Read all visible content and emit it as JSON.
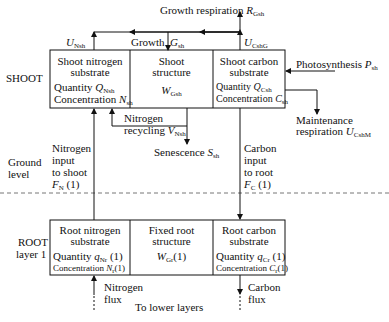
{
  "shoot": {
    "label": "SHOOT",
    "nitrogen_substrate": {
      "title1": "Shoot nitrogen",
      "title2": "substrate",
      "quantity_label": "Quantity",
      "quantity_sym": "Q",
      "quantity_sub": "Nsh",
      "conc_label": "Concentration",
      "conc_sym": "N",
      "conc_sub": "sh"
    },
    "structure": {
      "title1": "Shoot",
      "title2": "structure",
      "sym": "W",
      "sub": "Gsh"
    },
    "carbon_substrate": {
      "title1": "Shoot carbon",
      "title2": "substrate",
      "quantity_label": "Quantity",
      "quantity_sym": "Q",
      "quantity_sub": "Csh",
      "conc_label": "Concentration",
      "conc_sym": "C",
      "conc_sub": "sh"
    }
  },
  "root": {
    "label1": "ROOT",
    "label2": "layer 1",
    "nitrogen_substrate": {
      "title1": "Root nitrogen",
      "title2": "substrate",
      "quantity_label": "Quantity",
      "quantity_sym": "q",
      "quantity_sub": "Nr",
      "quantity_arg": "(1)",
      "conc_label": "Concentration",
      "conc_sym": "N",
      "conc_sub": "r",
      "conc_arg": "(1)"
    },
    "structure": {
      "title1": "Fixed root",
      "title2": "structure",
      "sym": "W",
      "sub": "Gr",
      "arg": "(1)"
    },
    "carbon_substrate": {
      "title1": "Root carbon",
      "title2": "substrate",
      "quantity_label": "Quantity",
      "quantity_sym": "q",
      "quantity_sub": "Cr",
      "quantity_arg": "(1)",
      "conc_label": "Concentration",
      "conc_sym": "C",
      "conc_sub": "r",
      "conc_arg": "(1)"
    }
  },
  "flows": {
    "growth_respiration": {
      "label": "Growth respiration",
      "sym": "R",
      "sub": "Gsh"
    },
    "u_nsh": {
      "sym": "U",
      "sub": "Nsh"
    },
    "growth": {
      "label": "Growth",
      "sym": "G",
      "sub": "sh"
    },
    "u_cshg": {
      "sym": "U",
      "sub": "CshG"
    },
    "photosynthesis": {
      "label": "Photosynthesis",
      "sym": "P",
      "sub": "sh"
    },
    "maintenance": {
      "label1": "Maintenance",
      "label2": "respiration",
      "sym": "U",
      "sub": "CshM"
    },
    "nitrogen_recycling": {
      "label1": "Nitrogen",
      "label2": "recycling",
      "sym": "V",
      "sub": "Nsh"
    },
    "senescence": {
      "label": "Senescence",
      "sym": "S",
      "sub": "sh"
    },
    "nitrogen_input": {
      "l1": "Nitrogen",
      "l2": "input",
      "l3": "to shoot",
      "sym": "F",
      "sub": "N",
      "arg": "(1)"
    },
    "carbon_input": {
      "l1": "Carbon",
      "l2": "input",
      "l3": "to root",
      "sym": "F",
      "sub": "C",
      "arg": "(1)"
    },
    "nitrogen_flux": {
      "l1": "Nitrogen",
      "l2": "flux"
    },
    "carbon_flux": {
      "l1": "Carbon",
      "l2": "flux"
    },
    "lower_layers": "To lower layers"
  },
  "ground": {
    "l1": "Ground",
    "l2": "level"
  }
}
